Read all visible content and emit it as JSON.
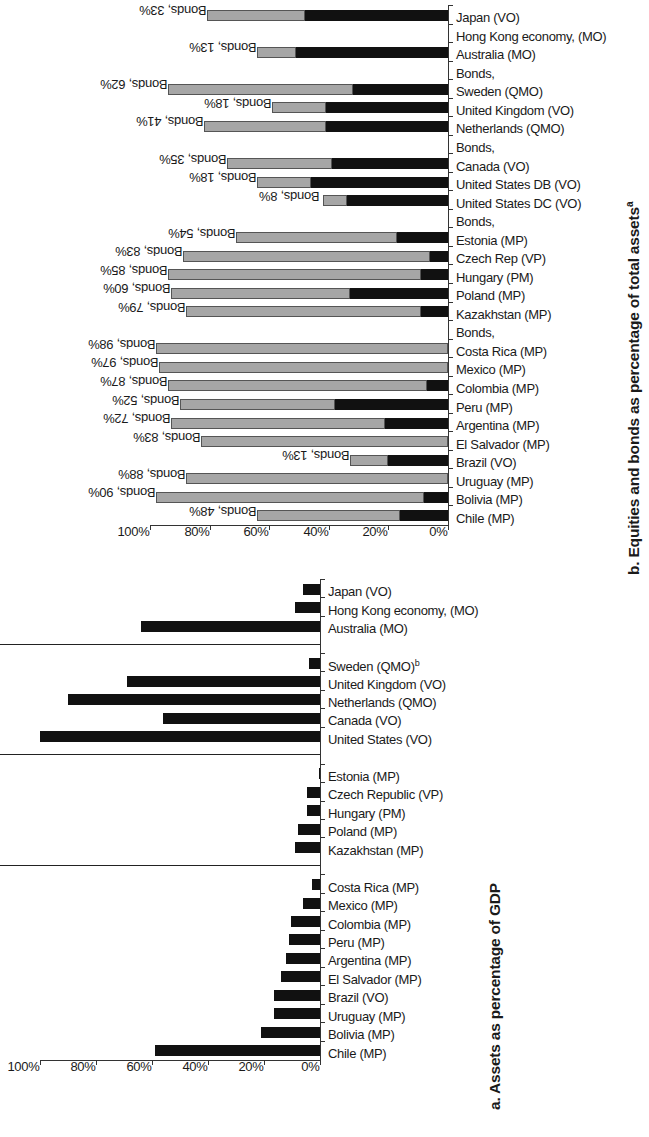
{
  "panel_b": {
    "title": "b. Equities and bonds as percentage of total assets",
    "title_sup": "a",
    "y_ticks": [
      "0%",
      "20%",
      "40%",
      "60%",
      "80%",
      "100%"
    ],
    "legend_names": [
      "Equities",
      "Bonds"
    ],
    "colors": {
      "equities": "#111111",
      "bonds": "#a6a6a6"
    }
  },
  "panel_a": {
    "title": "a. Assets as percentage of GDP",
    "y_ticks": [
      "0%",
      "20%",
      "40%",
      "60%",
      "80%",
      "100%"
    ],
    "colors": {
      "bar": "#111111"
    }
  },
  "chart_data": [
    {
      "id": "chart_b",
      "type": "bar",
      "stacked": true,
      "title": "b. Equities and bonds as percentage of total assetsᵃ",
      "xlabel": "",
      "ylabel": "Percentage of total assets",
      "ylim": [
        0,
        100
      ],
      "yticks": [
        0,
        20,
        40,
        60,
        80,
        100
      ],
      "grid": false,
      "legend": [
        "Equities",
        "Bonds"
      ],
      "orientation": "vertical-rotated-90",
      "categories": [
        "Chile (MP)",
        "Bolivia (MP)",
        "Uruguay (MP)",
        "Brazil (VO)",
        "El Salvador (MP)",
        "Argentina (MP)",
        "Peru (MP)",
        "Colombia (MP)",
        "Mexico (MP)",
        "Costa Rica (MP)",
        "Bonds,",
        "Kazakhstan (MP)",
        "Poland (MP)",
        "Hungary (PM)",
        "Czech Rep (VP)",
        "Estonia (MP)",
        "Bonds,",
        "United States DC (VO)",
        "United States DB (VO)",
        "Canada (VO)",
        "Bonds,",
        "Netherlands (QMO)",
        "United Kingdom (VO)",
        "Sweden (QMO)",
        "Bonds,",
        "Australia (MO)",
        "Hong Kong economy, (MO)",
        "Japan (VO)"
      ],
      "series": [
        {
          "name": "Equities",
          "values": [
            16,
            8,
            0,
            20,
            0,
            21,
            38,
            7,
            0,
            0,
            null,
            9,
            33,
            9,
            6,
            17,
            null,
            34,
            46,
            39,
            null,
            41,
            41,
            32,
            null,
            51,
            0,
            48
          ]
        },
        {
          "name": "Bonds",
          "values": [
            48,
            90,
            88,
            13,
            83,
            72,
            52,
            87,
            97,
            98,
            null,
            79,
            60,
            85,
            83,
            54,
            null,
            8,
            18,
            35,
            null,
            41,
            18,
            62,
            null,
            13,
            0,
            33
          ]
        }
      ],
      "data_labels": [
        "Bonds, 48%",
        "Bonds, 90%",
        "Bonds, 88%",
        "Bonds, 13%",
        "Bonds, 83%",
        "Bonds, 72%",
        "Bonds, 52%",
        "Bonds, 87%",
        "Bonds, 97%",
        "Bonds, 98%",
        null,
        "Bonds, 79%",
        "Bonds, 60%",
        "Bonds, 85%",
        "Bonds, 83%",
        "Bonds, 54%",
        null,
        "Bonds, 8%",
        "Bonds, 18%",
        "Bonds, 35%",
        null,
        "Bonds, 41%",
        "Bonds, 18%",
        "Bonds, 62%",
        null,
        "Bonds, 13%",
        null,
        "Bonds, 33%"
      ],
      "bar_totals": [
        64,
        98,
        88,
        33,
        83,
        93,
        90,
        94,
        97,
        98,
        null,
        88,
        93,
        94,
        89,
        71,
        null,
        43,
        64,
        74,
        null,
        82,
        59,
        94,
        null,
        64,
        0,
        81
      ]
    },
    {
      "id": "chart_a",
      "type": "bar",
      "stacked": false,
      "title": "a. Assets as percentage of GDP",
      "xlabel": "",
      "ylabel": "Assets as percentage of GDP",
      "ylim": [
        0,
        100
      ],
      "yticks": [
        0,
        20,
        40,
        60,
        80,
        100
      ],
      "grid": false,
      "orientation": "vertical-rotated-90",
      "categories": [
        "Chile (MP)",
        "Bolivia (MP)",
        "Uruguay (MP)",
        "Brazil (VO)",
        "El Salvador (MP)",
        "Argentina (MP)",
        "Peru (MP)",
        "Colombia (MP)",
        "Mexico (MP)",
        "Costa Rica (MP)",
        "Kazakhstan (MP)",
        "Poland (MP)",
        "Hungary (PM)",
        "Czech Republic (VP)",
        "Estonia (MP)",
        "United States (VO)",
        "Canada (VO)",
        "Netherlands (QMO)",
        "United Kingdom (VO)",
        "Sweden (QMO)",
        "Australia (MO)",
        "Hong Kong economy, (MO)",
        "Japan (VO)"
      ],
      "category_superscripts": {
        "Sweden (QMO)": "b"
      },
      "values": [
        59,
        21,
        16.5,
        16.5,
        14,
        12,
        11,
        10.5,
        6,
        3,
        9,
        8,
        4.5,
        4.5,
        0.5,
        100,
        56,
        90,
        69,
        4,
        64,
        9,
        6
      ],
      "group_breaks_after": [
        9,
        14,
        19
      ],
      "groups": [
        {
          "name": "Latin America",
          "start": 0,
          "end": 9
        },
        {
          "name": "Eastern Europe",
          "start": 10,
          "end": 14
        },
        {
          "name": "North America",
          "start": 15,
          "end": 19
        },
        {
          "name": "Asia Pacific",
          "start": 20,
          "end": 22
        }
      ]
    }
  ]
}
